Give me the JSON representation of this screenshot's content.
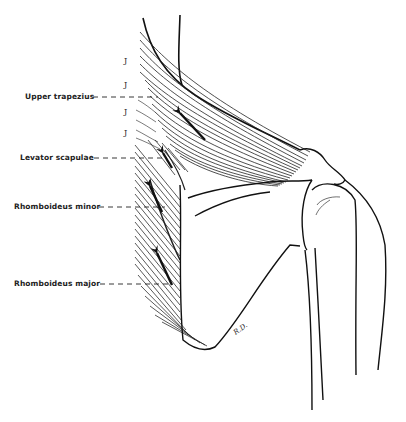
{
  "figure": {
    "type": "anatomical line drawing",
    "labels": [
      {
        "id": "upper_trapezius",
        "text": "Upper trapezius",
        "x": 25,
        "y": 92,
        "line_to_x": 160,
        "line_y": 97
      },
      {
        "id": "levator_scapulae",
        "text": "Levator scapulae",
        "x": 20,
        "y": 153,
        "line_to_x": 165,
        "line_y": 158
      },
      {
        "id": "rhomboideus_minor",
        "text": "Rhomboideus minor",
        "x": 14,
        "y": 202,
        "line_to_x": 165,
        "line_y": 207
      },
      {
        "id": "rhomboideus_major",
        "text": "Rhomboideus major",
        "x": 14,
        "y": 279,
        "line_to_x": 170,
        "line_y": 284
      }
    ],
    "vertebra_marks": [
      "J",
      "J",
      "J",
      "J"
    ],
    "signature": "R.D.",
    "arrows": [
      {
        "muscle": "upper_trapezius",
        "direction": "up-left"
      },
      {
        "muscle": "levator_scapulae",
        "direction": "up-left"
      },
      {
        "muscle": "rhomboideus_minor",
        "direction": "up-left"
      },
      {
        "muscle": "rhomboideus_major",
        "direction": "up-left"
      }
    ],
    "colors": {
      "ink": "#1a1a1a",
      "background": "#ffffff"
    }
  }
}
